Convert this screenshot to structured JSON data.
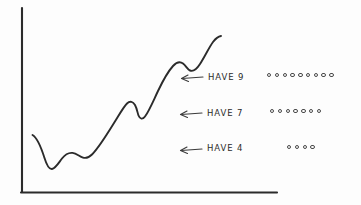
{
  "figure": {
    "title": "",
    "background_color": "#fdfdfd",
    "ink_color": "#2b2b2b"
  },
  "axes": {
    "y_axis_name": "y-axis",
    "x_axis_name": "x-axis",
    "origin": {
      "x": 22,
      "y": 193
    },
    "y_top": 8,
    "x_right": 277,
    "tick_labels": [],
    "x_label": "",
    "y_label": ""
  },
  "chart_data": {
    "type": "line",
    "title": "",
    "xlabel": "",
    "ylabel": "",
    "grid": false,
    "legend": "none",
    "xlim": [
      0,
      100
    ],
    "ylim": [
      0,
      100
    ],
    "series": [
      {
        "name": "trend-curve",
        "x": [
          5,
          9,
          14,
          19,
          24,
          30,
          36,
          41,
          46,
          50,
          55,
          60,
          65,
          70,
          76,
          81,
          86,
          91,
          96
        ],
        "y": [
          31,
          24,
          14,
          13,
          19,
          20,
          19,
          24,
          32,
          40,
          52,
          56,
          50,
          54,
          65,
          74,
          72,
          75,
          84
        ]
      }
    ]
  },
  "annotations": [
    {
      "id": "annotation-have-9",
      "label": "HAVE 9",
      "count": 9,
      "arrow_direction": "left",
      "marker_shape": "circle-outline",
      "row_top": 72
    },
    {
      "id": "annotation-have-7",
      "label": "HAVE 7",
      "count": 7,
      "arrow_direction": "left",
      "marker_shape": "circle-outline",
      "row_top": 108
    },
    {
      "id": "annotation-have-4",
      "label": "HAVE 4",
      "count": 4,
      "arrow_direction": "left",
      "marker_shape": "circle-outline",
      "row_top": 143
    }
  ],
  "dot_rows": {
    "row_1_left": 267,
    "row_2_left": 270,
    "row_3_left": 287
  }
}
